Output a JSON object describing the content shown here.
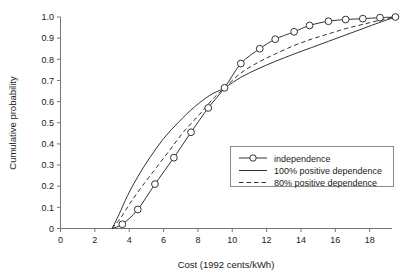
{
  "chart_data": {
    "type": "line",
    "title": "",
    "xlabel": "Cost (1992 cents/kWh)",
    "ylabel": "Cumulative probability",
    "xlim": [
      0,
      19.3
    ],
    "ylim": [
      0,
      1.0
    ],
    "grid": false,
    "legend_position": "center-right",
    "xticks": [
      0,
      2,
      4,
      6,
      8,
      10,
      12,
      14,
      16,
      18
    ],
    "xtick_labels": [
      "0",
      "2",
      "4",
      "6",
      "8",
      "10",
      "12",
      "14",
      "16",
      "18"
    ],
    "yticks": [
      0,
      0.1,
      0.2,
      0.3,
      0.4,
      0.5,
      0.6,
      0.7,
      0.8,
      0.9,
      1.0
    ],
    "ytick_labels": [
      "0",
      "0.1",
      "0.2",
      "0.3",
      "0.4",
      "0.5",
      "0.6",
      "0.7",
      "0.8",
      "0.9",
      "1.0"
    ],
    "series": [
      {
        "name": "independence",
        "style": "solid-with-markers",
        "marker": "open-circle",
        "x": [
          3.0,
          3.6,
          4.5,
          5.5,
          6.6,
          7.6,
          8.6,
          9.55,
          10.5,
          11.6,
          12.5,
          13.6,
          14.5,
          15.6,
          16.6,
          17.6,
          18.6,
          19.5
        ],
        "y": [
          0.0,
          0.02,
          0.09,
          0.21,
          0.335,
          0.455,
          0.57,
          0.665,
          0.78,
          0.85,
          0.895,
          0.93,
          0.96,
          0.98,
          0.988,
          0.992,
          0.997,
          1.0
        ]
      },
      {
        "name": "100% positive dependence",
        "style": "solid",
        "marker": "none",
        "x": [
          3.0,
          3.4,
          3.9,
          4.5,
          5.2,
          6.0,
          6.9,
          7.8,
          8.7,
          9.55,
          10.5,
          11.5,
          12.5,
          13.6,
          14.6,
          15.6,
          16.6,
          17.6,
          18.6,
          19.5
        ],
        "y": [
          0.0,
          0.065,
          0.155,
          0.245,
          0.335,
          0.425,
          0.505,
          0.575,
          0.63,
          0.665,
          0.715,
          0.755,
          0.79,
          0.825,
          0.855,
          0.885,
          0.915,
          0.945,
          0.975,
          1.0
        ]
      },
      {
        "name": "80% positive dependence",
        "style": "dashed",
        "marker": "none",
        "x": [
          3.0,
          3.5,
          4.1,
          4.8,
          5.6,
          6.4,
          7.2,
          8.1,
          8.9,
          9.55,
          10.5,
          11.5,
          12.5,
          13.6,
          14.6,
          15.6,
          16.6,
          17.6,
          18.6,
          19.5
        ],
        "y": [
          0.0,
          0.05,
          0.125,
          0.205,
          0.29,
          0.375,
          0.46,
          0.54,
          0.615,
          0.665,
          0.735,
          0.785,
          0.825,
          0.865,
          0.895,
          0.92,
          0.945,
          0.965,
          0.985,
          1.0
        ]
      }
    ]
  },
  "legend": {
    "entries": [
      {
        "label": "independence"
      },
      {
        "label": "100% positive dependence"
      },
      {
        "label": "80% positive dependence"
      }
    ]
  }
}
